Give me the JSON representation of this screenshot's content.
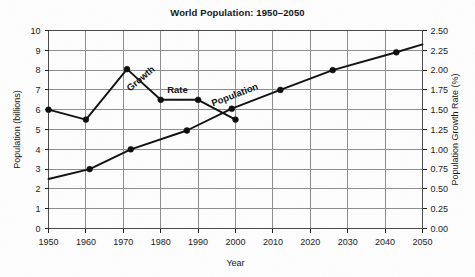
{
  "chart_data": {
    "type": "line",
    "title": "World Population: 1950–2050",
    "xlabel": "Year",
    "ylabel": "Population (billions)",
    "y2label": "Population Growth Rate (%)",
    "xlim": [
      1950,
      2050
    ],
    "ylim": [
      0,
      10
    ],
    "y2lim": [
      0.0,
      2.5
    ],
    "xticks": [
      "1950",
      "1960",
      "1970",
      "1980",
      "1990",
      "2000",
      "2010",
      "2020",
      "2030",
      "2040",
      "2050"
    ],
    "yticks": [
      "0",
      "1",
      "2",
      "3",
      "4",
      "5",
      "6",
      "7",
      "8",
      "9",
      "10"
    ],
    "y2ticks": [
      "0.00",
      "0.25",
      "0.50",
      "0.75",
      "1.00",
      "1.25",
      "1.50",
      "1.75",
      "2.00",
      "2.25",
      "2.50"
    ],
    "grid": true,
    "legend_position": "inline-labels",
    "series": [
      {
        "name": "Population",
        "axis": "left",
        "unit": "billions",
        "label_text": "Population",
        "label_rotation": -21,
        "x": [
          1950,
          1961,
          1972,
          1987,
          1999,
          2012,
          2026,
          2043,
          2050
        ],
        "values": [
          2.5,
          3.0,
          4.0,
          4.95,
          6.05,
          7.0,
          8.0,
          8.9,
          9.3
        ],
        "markers_shown": [
          false,
          true,
          true,
          true,
          true,
          true,
          true,
          true,
          false
        ]
      },
      {
        "name": "Growth Rate",
        "axis": "right",
        "unit": "percent",
        "label_text_1": "Growth",
        "label_text_2": "Rate",
        "label_rotation_1": -40,
        "x": [
          1950,
          1960,
          1971,
          1980,
          1990,
          2000
        ],
        "values": [
          1.5,
          1.375,
          2.0125,
          1.625,
          1.625,
          1.375
        ],
        "values_left_scale": [
          6.0,
          5.5,
          8.05,
          6.5,
          6.5,
          5.5
        ],
        "markers_shown": [
          true,
          true,
          true,
          true,
          true,
          true
        ]
      }
    ]
  },
  "colors": {
    "background": "#fdfdfd",
    "line": "#111111",
    "gridline": "#8d8d8d",
    "frame": "#4a4a4a",
    "text": "#141414"
  }
}
